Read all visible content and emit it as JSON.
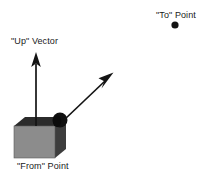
{
  "figure": {
    "width": 208,
    "height": 179,
    "background_color": "#ffffff"
  },
  "labels": {
    "to_point": "\"To\" Point",
    "up_vector": "\"Up\" Vector",
    "from_point": "\"From\" Point"
  },
  "colors": {
    "stroke": "#141414",
    "cube_front": "#8c8c8c",
    "cube_top": "#2b2b2b",
    "cube_side": "#3d3d3d",
    "lens": "#111111",
    "text": "#1a1a1a"
  },
  "geometry": {
    "to_point_dot": {
      "cx": 175,
      "cy": 25,
      "r": 3.6
    },
    "up_arrow": {
      "x1": 36,
      "y1": 125,
      "x2": 36,
      "y2": 53
    },
    "view_arrow": {
      "x1": 64,
      "y1": 120,
      "x2": 112,
      "y2": 74
    },
    "cube_front": {
      "x": 14,
      "y": 126,
      "w": 41,
      "h": 32
    },
    "lens": {
      "cx": 60,
      "cy": 120,
      "r": 7.5
    }
  }
}
